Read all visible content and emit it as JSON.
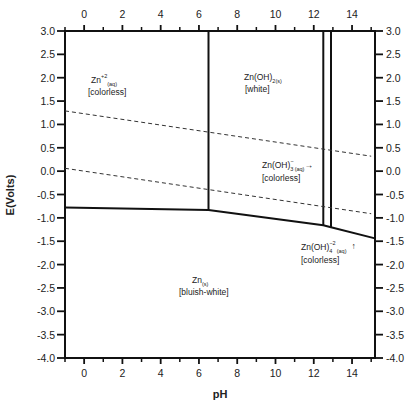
{
  "chart_data": {
    "type": "diagram",
    "title": "",
    "xlabel": "pH",
    "ylabel": "E(Volts)",
    "xlim": [
      -1,
      15.2
    ],
    "ylim": [
      -4.0,
      3.0
    ],
    "x_ticks_major": [
      0,
      2,
      4,
      6,
      8,
      10,
      12,
      14
    ],
    "x_ticks_minor": [
      -1,
      1,
      3,
      5,
      7,
      9,
      11,
      13,
      15
    ],
    "y_ticks": [
      "3.0",
      "2.5",
      "2.0",
      "1.5",
      "1.0",
      "0.5",
      "0.0",
      "-0.5",
      "-1.0",
      "-1.5",
      "-2.0",
      "-2.5",
      "-3.0",
      "-3.5",
      "-4.0"
    ],
    "y_tick_values": [
      3.0,
      2.5,
      2.0,
      1.5,
      1.0,
      0.5,
      0.0,
      -0.5,
      -1.0,
      -1.5,
      -2.0,
      -2.5,
      -3.0,
      -3.5,
      -4.0
    ],
    "grid": false,
    "solid_boundaries": [
      {
        "name": "Zn2+/Zn(OH)2",
        "points": [
          [
            6.5,
            3.0
          ],
          [
            6.5,
            -0.83
          ]
        ]
      },
      {
        "name": "Zn(OH)2/Zn(OH)3-",
        "points": [
          [
            12.5,
            3.0
          ],
          [
            12.5,
            -1.16
          ]
        ]
      },
      {
        "name": "Zn(OH)3-/Zn(OH)4-2",
        "points": [
          [
            12.9,
            3.0
          ],
          [
            12.9,
            -1.2
          ]
        ]
      },
      {
        "name": "Zn reduction line",
        "points": [
          [
            -1,
            -0.78
          ],
          [
            6.5,
            -0.83
          ],
          [
            12.5,
            -1.16
          ],
          [
            12.9,
            -1.2
          ],
          [
            15.2,
            -1.44
          ]
        ]
      }
    ],
    "dashed_lines": [
      {
        "name": "O2/H2O",
        "points": [
          [
            -1,
            1.29
          ],
          [
            15.0,
            0.32
          ]
        ]
      },
      {
        "name": "H2O/H2",
        "points": [
          [
            -1,
            0.06
          ],
          [
            15.0,
            -0.91
          ]
        ]
      }
    ],
    "regions": [
      {
        "species": "Zn",
        "charge": "+2",
        "state": "(aq)",
        "color": "[colorless]",
        "x": 2.5,
        "y": 2.0
      },
      {
        "species": "Zn(OH)",
        "subscript": "2(s)",
        "color": "[white]",
        "x": 9.5,
        "y": 2.0
      },
      {
        "species": "Zn(OH)",
        "subscript": "3",
        "charge": "−",
        "state": "(aq)",
        "arrow": "→",
        "color": "[colorless]",
        "x": 11.0,
        "y": 0.0
      },
      {
        "species": "Zn(OH)",
        "subscript": "4",
        "charge": "−2",
        "state": "(aq)",
        "arrow": "↑",
        "color": "[colorless]",
        "x": 13.5,
        "y": -1.6
      },
      {
        "species": "Zn",
        "subscript": "(s)",
        "color": "[bluish-white]",
        "x": 5.5,
        "y": -2.5
      }
    ]
  },
  "labels": {
    "xlabel": "pH",
    "ylabel": "E(Volts)",
    "zn2": {
      "main": "Zn",
      "sup": "+2",
      "sub": "(aq)",
      "desc": "[colorless]"
    },
    "znoh2": {
      "main": "Zn(OH)",
      "sub": "2(s)",
      "desc": "[white]"
    },
    "znoh3": {
      "main": "Zn(OH)",
      "sub": "3",
      "sup": "−",
      "sub2": "(aq)",
      "arrow": "→",
      "desc": "[colorless]"
    },
    "znoh4": {
      "main": "Zn(OH)",
      "sub": "4",
      "sup": "−2",
      "sub2": "(aq)",
      "arrow": "↑",
      "desc": "[colorless]"
    },
    "zn": {
      "main": "Zn",
      "sub": "(s)",
      "desc": "[bluish-white]"
    }
  },
  "style": {
    "line_color": "#111111",
    "dash_color": "#333333",
    "text_color": "#222222",
    "background": "#ffffff"
  }
}
